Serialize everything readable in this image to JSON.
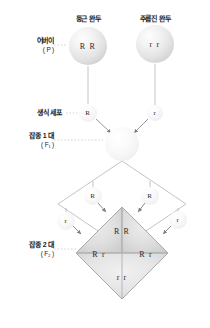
{
  "diagram": {
    "type": "genetics-cross-punnett"
  },
  "top_labels": [
    {
      "id": "round-pea",
      "text": "둥근 완두",
      "x": 88,
      "y": 16
    },
    {
      "id": "wrinkled-pea",
      "text": "주름진 완두",
      "x": 155,
      "y": 16
    }
  ],
  "side_labels": [
    {
      "id": "parent",
      "gen": "어버이",
      "sub": "( P )",
      "x": 44,
      "y": 40
    },
    {
      "id": "gamete",
      "gen": "생식 세포",
      "sub": "",
      "x": 44,
      "y": 112
    },
    {
      "id": "f1",
      "gen": "잡종 1 대",
      "sub": "( F₁ )",
      "x": 44,
      "y": 131
    },
    {
      "id": "f2",
      "gen": "잡종 2 대",
      "sub": "( F₂ )",
      "x": 44,
      "y": 245
    }
  ],
  "parents": [
    {
      "id": "parent-round",
      "genotype": "R R",
      "cx": 88,
      "cy": 46,
      "r": 19
    },
    {
      "id": "parent-wrinkled",
      "genotype": "r r",
      "cx": 155,
      "cy": 44,
      "r": 19
    }
  ],
  "parent_gametes": [
    {
      "id": "gamete-p-R",
      "allele": "R",
      "cx": 88,
      "cy": 113,
      "r": 9
    },
    {
      "id": "gamete-p-r",
      "allele": "r",
      "cx": 155,
      "cy": 113,
      "r": 8
    }
  ],
  "f1_individual": {
    "id": "f1-sphere",
    "genotype": "",
    "cx": 122,
    "cy": 144,
    "r": 17
  },
  "f1_gametes": [
    {
      "id": "f1-gamete-top-left",
      "allele": "R",
      "cx": 93,
      "cy": 196,
      "r": 9
    },
    {
      "id": "f1-gamete-top-right",
      "allele": "R",
      "cx": 150,
      "cy": 196,
      "r": 9
    },
    {
      "id": "f1-gamete-left",
      "allele": "r",
      "cx": 66,
      "cy": 221,
      "r": 9
    },
    {
      "id": "f1-gamete-right",
      "allele": "r",
      "cx": 178,
      "cy": 220,
      "r": 9
    }
  ],
  "punnett": {
    "center_x": 122,
    "center_y": 253,
    "half_diagonal": 46,
    "cells": [
      {
        "id": "cell-top",
        "genotype": "R R",
        "x": 122,
        "y": 230
      },
      {
        "id": "cell-left",
        "genotype": "R r",
        "x": 99,
        "y": 253
      },
      {
        "id": "cell-right",
        "genotype": "R r",
        "x": 145,
        "y": 253
      },
      {
        "id": "cell-bottom",
        "genotype": "r r",
        "x": 122,
        "y": 276
      }
    ]
  },
  "ratios": {
    "genotype": "1 : 2 : 1",
    "phenotype": "3 : 1"
  },
  "colors": {
    "line": "#b9b9b9",
    "dotted": "#c9c9c9",
    "arrow": "#7d7d7d",
    "cell_fill_light": "#e9e9e9",
    "cell_fill_dark": "#dcdcdc",
    "cell_border": "#b0b0b0",
    "text": "#1a1a1a",
    "allele_text": "#2b2b2b"
  }
}
